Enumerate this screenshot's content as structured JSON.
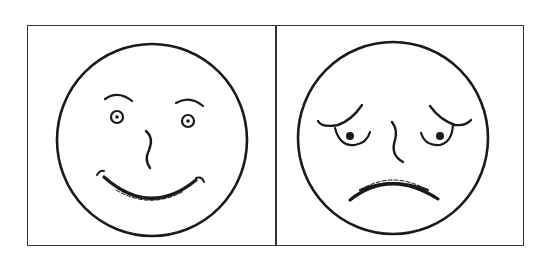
{
  "figure": {
    "panels": [
      {
        "id": "happy",
        "label": "happy-face",
        "expression": "smiling"
      },
      {
        "id": "sad",
        "label": "sad-face",
        "expression": "worried"
      }
    ],
    "stroke_color": "#1a1a1a",
    "border_color": "#333333",
    "background": "#ffffff"
  }
}
